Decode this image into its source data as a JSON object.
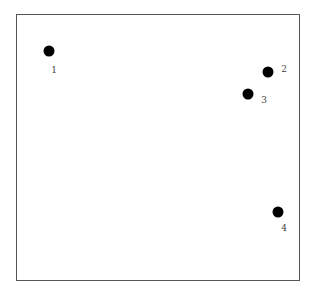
{
  "diagram": {
    "frame": {
      "border_color": "#555555"
    },
    "points": [
      {
        "label": "1",
        "x": 49,
        "y": 51,
        "label_x": 54,
        "label_y": 70
      },
      {
        "label": "2",
        "x": 268,
        "y": 72,
        "label_x": 284,
        "label_y": 69
      },
      {
        "label": "3",
        "x": 248,
        "y": 94,
        "label_x": 264,
        "label_y": 100
      },
      {
        "label": "4",
        "x": 278,
        "y": 212,
        "label_x": 284,
        "label_y": 228
      }
    ]
  }
}
